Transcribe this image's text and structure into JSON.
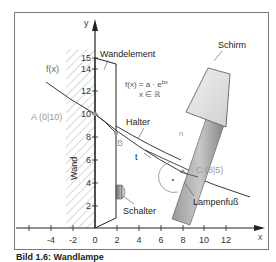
{
  "figure": {
    "axes": {
      "x_label": "x",
      "y_label": "y",
      "x_ticks": [
        "-4",
        "-2",
        "0",
        "2",
        "4",
        "6",
        "8",
        "10",
        "12"
      ],
      "y_ticks": [
        "2",
        "4",
        "6",
        "8",
        "10",
        "12",
        "14",
        "15"
      ]
    },
    "labels": {
      "wandelement": "Wandelement",
      "function_left": "f(x)",
      "formula_line1": "f(x) = a · e",
      "formula_exp": "bx",
      "formula_line2": "x ∈ ℝ",
      "schirm": "Schirm",
      "halter": "Halter",
      "point_a": "A (0|10)",
      "point_b": "B",
      "point_c": "C (8|5)",
      "normal": "n",
      "tangent": "t",
      "wand": "Wand",
      "schalter": "Schalter",
      "lampenfuss": "Lampenfuß"
    },
    "points": [
      {
        "name": "A",
        "x": 0,
        "y": 10
      },
      {
        "name": "C",
        "x": 8,
        "y": 5
      }
    ],
    "colors": {
      "frame": "#7a7a7a",
      "axis": "#222222",
      "curve": "#3a3a3a",
      "label_gray": "#9a9a9a",
      "lamp_body": "#8c8c8c",
      "shade_fill": "#e4e4e4"
    }
  },
  "caption": "Bild 1.6: Wandlampe"
}
